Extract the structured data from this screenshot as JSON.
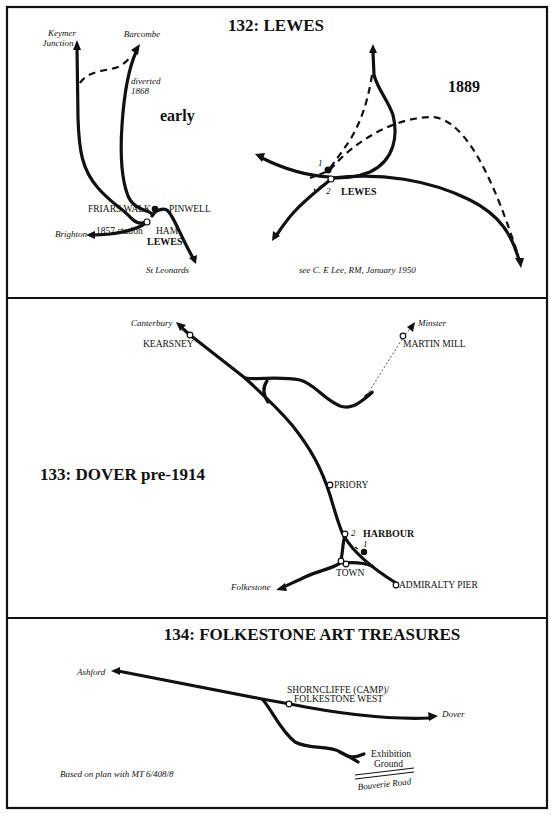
{
  "panels": {
    "lewes": {
      "title": "132:  LEWES",
      "early": {
        "era_label": "early",
        "destinations": {
          "keymer_line1": "Keymer",
          "keymer_line2": "Junction",
          "barcombe": "Barcombe",
          "brighton": "Brighton",
          "st_leonards": "St Leonards"
        },
        "annotation_line1": "diverted",
        "annotation_line2": "1868",
        "stations": {
          "friars_walk": "FRIARS WALK",
          "pinwell": "PINWELL",
          "station_1857": "1857 station",
          "ham": "HAM",
          "lewes": "LEWES"
        }
      },
      "later": {
        "era_label": "1889",
        "station": "LEWES",
        "platform_1": "1",
        "platform_2": "2",
        "source_note": "see C. E Lee, RM, January 1950"
      }
    },
    "dover": {
      "title": "133:  DOVER pre-1914",
      "destinations": {
        "canterbury": "Canterbury",
        "minster": "Minster",
        "folkestone": "Folkestone"
      },
      "stations": {
        "kearsney": "KEARSNEY",
        "martin_mill": "MARTIN MILL",
        "priory": "PRIORY",
        "harbour": "HARBOUR",
        "town": "TOWN",
        "admiralty_pier": "ADMIRALTY PIER"
      },
      "harbour_label_1": "1",
      "harbour_label_2": "2"
    },
    "folkestone": {
      "title": "134:  FOLKESTONE ART TREASURES",
      "destinations": {
        "ashford": "Ashford",
        "dover": "Dover"
      },
      "stations": {
        "shorncliffe_line1": "SHORNCLIFFE (CAMP)/",
        "shorncliffe_line2": "FOLKESTONE WEST"
      },
      "exhibition_line1": "Exhibition",
      "exhibition_line2": "Ground",
      "road": "Bouverie Road",
      "source_note": "Based on plan with MT 6/408/8"
    }
  }
}
